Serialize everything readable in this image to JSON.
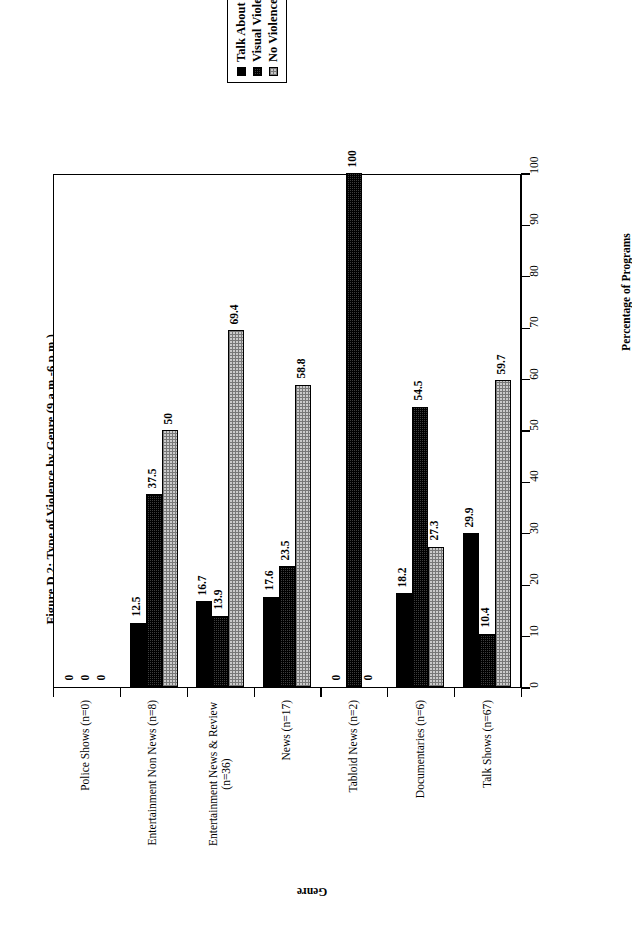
{
  "figure": {
    "title": "Figure D.2: Type of Violence by Genre (9 a.m.-6 p.m.)",
    "orientation_note": "rotated"
  },
  "legend": {
    "entries": [
      {
        "label": "Talk About Violence",
        "swatch": "solid-black",
        "color": "#000000"
      },
      {
        "label": "Visual Violence",
        "swatch": "dense-hatch",
        "color": "#3d3d3d"
      },
      {
        "label": "No Violence",
        "swatch": "light-stipple",
        "color": "#cbcbcb"
      }
    ]
  },
  "axes": {
    "value_axis_title": "Percentage of Programs",
    "category_axis_title": "Genre",
    "value_ticks": [
      "0",
      "10",
      "20",
      "30",
      "40",
      "50",
      "60",
      "70",
      "80",
      "90",
      "100"
    ]
  },
  "chart_data": {
    "type": "bar",
    "title": "Figure D.2: Type of Violence by Genre (9 a.m.-6 p.m.)",
    "xlabel": "Genre",
    "ylabel": "Percentage of Programs",
    "ylim": [
      0,
      100
    ],
    "grid": false,
    "legend_position": "top-center",
    "categories": [
      "Police Shows (n=0)",
      "Entertainment Non News (n=8)",
      "Entertainment News & Review (n=36)",
      "News (n=17)",
      "Tabloid News (n=2)",
      "Documentaries (n=6)",
      "Talk Shows (n=67)"
    ],
    "category_lines": [
      [
        "Police Shows (n=0)"
      ],
      [
        "Entertainment Non News (n=8)"
      ],
      [
        "Entertainment News & Review",
        "(n=36)"
      ],
      [
        "News (n=17)"
      ],
      [
        "Tabloid News (n=2)"
      ],
      [
        "Documentaries (n=6)"
      ],
      [
        "Talk Shows (n=67)"
      ]
    ],
    "series": [
      {
        "name": "Talk About Violence",
        "values": [
          0,
          12.5,
          16.7,
          17.6,
          0,
          18.2,
          29.9
        ],
        "labels": [
          "0",
          "12.5",
          "16.7",
          "17.6",
          "0",
          "18.2",
          "29.9"
        ]
      },
      {
        "name": "Visual Violence",
        "values": [
          0,
          37.5,
          13.9,
          23.5,
          100,
          54.5,
          10.4
        ],
        "labels": [
          "0",
          "37.5",
          "13.9",
          "23.5",
          "100",
          "54.5",
          "10.4"
        ]
      },
      {
        "name": "No Violence",
        "values": [
          0,
          50,
          69.4,
          58.8,
          0,
          27.3,
          59.7
        ],
        "labels": [
          "0",
          "50",
          "69.4",
          "58.8",
          "0",
          "27.3",
          "59.7"
        ]
      }
    ]
  }
}
